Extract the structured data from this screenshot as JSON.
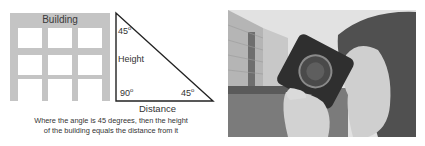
{
  "diagram": {
    "building_label": "Building",
    "triangle": {
      "top_angle": "45",
      "side_label": "Height",
      "right_angle": "90",
      "bottom_angle": "45",
      "base_label": "Distance",
      "degree_symbol": "o"
    },
    "caption_line1": "Where the angle is 45 degrees, then the height",
    "caption_line2": "of the building equals the distance from it"
  },
  "photo": {
    "description": "Grayscale photo of a person holding a camera up to their eye, with a building in the background",
    "colors": {
      "sky": "#e6e6e6",
      "building": "#b8b8b8",
      "grass": "#7a7a7a",
      "camera": "#2e2e2e",
      "skin": "#c9c9c9",
      "hair": "#4a4a4a"
    }
  }
}
